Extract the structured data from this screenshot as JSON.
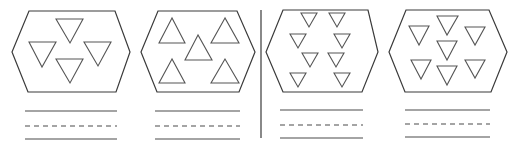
{
  "worksheet": {
    "panels": [
      {
        "id": "panel-1",
        "triangle_direction": "down",
        "triangle_count": 4,
        "hexagon": [
          [
            29,
            11
          ],
          [
            115,
            11
          ],
          [
            130,
            52
          ],
          [
            116,
            92
          ],
          [
            28,
            92
          ],
          [
            12,
            52
          ]
        ],
        "triangles": [
          [
            [
              56,
              19
            ],
            [
              83,
              19
            ],
            [
              70,
              43
            ]
          ],
          [
            [
              29,
              42
            ],
            [
              56,
              42
            ],
            [
              42,
              67
            ]
          ],
          [
            [
              84,
              42
            ],
            [
              111,
              42
            ],
            [
              98,
              66
            ]
          ],
          [
            [
              56,
              59
            ],
            [
              83,
              59
            ],
            [
              70,
              83
            ]
          ]
        ],
        "writing_lines": {
          "x1": 25,
          "x2": 117,
          "y_top": 111,
          "y_mid": 126,
          "y_bottom": 139
        }
      },
      {
        "id": "panel-2",
        "triangle_direction": "up",
        "triangle_count": 5,
        "hexagon": [
          [
            158,
            11
          ],
          [
            237,
            11
          ],
          [
            255,
            52
          ],
          [
            239,
            92
          ],
          [
            157,
            92
          ],
          [
            141,
            52
          ]
        ],
        "triangles": [
          [
            [
              172,
              18
            ],
            [
              159,
              43
            ],
            [
              185,
              43
            ]
          ],
          [
            [
              198,
              35
            ],
            [
              185,
              60
            ],
            [
              212,
              60
            ]
          ],
          [
            [
              225,
              18
            ],
            [
              211,
              43
            ],
            [
              239,
              43
            ]
          ],
          [
            [
              172,
              59
            ],
            [
              159,
              83
            ],
            [
              185,
              83
            ]
          ],
          [
            [
              225,
              59
            ],
            [
              211,
              83
            ],
            [
              239,
              83
            ]
          ]
        ],
        "writing_lines": {
          "x1": 155,
          "x2": 240,
          "y_top": 111,
          "y_mid": 126,
          "y_bottom": 139
        }
      },
      {
        "id": "panel-3",
        "triangle_direction": "down",
        "triangle_count": 8,
        "hexagon": [
          [
            283,
            10
          ],
          [
            368,
            10
          ],
          [
            378,
            52
          ],
          [
            362,
            92
          ],
          [
            283,
            92
          ],
          [
            266,
            52
          ]
        ],
        "triangles": [
          [
            [
              301,
              13
            ],
            [
              317,
              13
            ],
            [
              309,
              27
            ]
          ],
          [
            [
              329,
              13
            ],
            [
              345,
              13
            ],
            [
              337,
              27
            ]
          ],
          [
            [
              290,
              34
            ],
            [
              306,
              34
            ],
            [
              298,
              48
            ]
          ],
          [
            [
              334,
              34
            ],
            [
              350,
              34
            ],
            [
              342,
              48
            ]
          ],
          [
            [
              302,
              53
            ],
            [
              318,
              53
            ],
            [
              310,
              67
            ]
          ],
          [
            [
              328,
              53
            ],
            [
              344,
              53
            ],
            [
              336,
              67
            ]
          ],
          [
            [
              290,
              73
            ],
            [
              306,
              73
            ],
            [
              298,
              87
            ]
          ],
          [
            [
              334,
              73
            ],
            [
              350,
              73
            ],
            [
              342,
              87
            ]
          ]
        ],
        "writing_lines": {
          "x1": 280,
          "x2": 363,
          "y_top": 110,
          "y_mid": 125,
          "y_bottom": 138
        }
      },
      {
        "id": "panel-4",
        "triangle_direction": "down",
        "triangle_count": 7,
        "hexagon": [
          [
            406,
            10
          ],
          [
            489,
            10
          ],
          [
            507,
            52
          ],
          [
            491,
            92
          ],
          [
            405,
            92
          ],
          [
            389,
            52
          ]
        ],
        "triangles": [
          [
            [
              409,
              26
            ],
            [
              429,
              26
            ],
            [
              419,
              45
            ]
          ],
          [
            [
              437,
              16
            ],
            [
              458,
              16
            ],
            [
              447,
              35
            ]
          ],
          [
            [
              465,
              27
            ],
            [
              485,
              27
            ],
            [
              475,
              45
            ]
          ],
          [
            [
              437,
              41
            ],
            [
              457,
              41
            ],
            [
              447,
              60
            ]
          ],
          [
            [
              411,
              60
            ],
            [
              431,
              60
            ],
            [
              421,
              79
            ]
          ],
          [
            [
              437,
              66
            ],
            [
              457,
              66
            ],
            [
              447,
              85
            ]
          ],
          [
            [
              465,
              60
            ],
            [
              485,
              60
            ],
            [
              475,
              78
            ]
          ]
        ],
        "writing_lines": {
          "x1": 405,
          "x2": 490,
          "y_top": 110,
          "y_mid": 124,
          "y_bottom": 137
        }
      }
    ],
    "divider": {
      "x": 261,
      "y1": 10,
      "y2": 138
    },
    "colors": {
      "stroke": "#3a3a3a",
      "triangle": "#555555",
      "background": "#ffffff"
    }
  }
}
